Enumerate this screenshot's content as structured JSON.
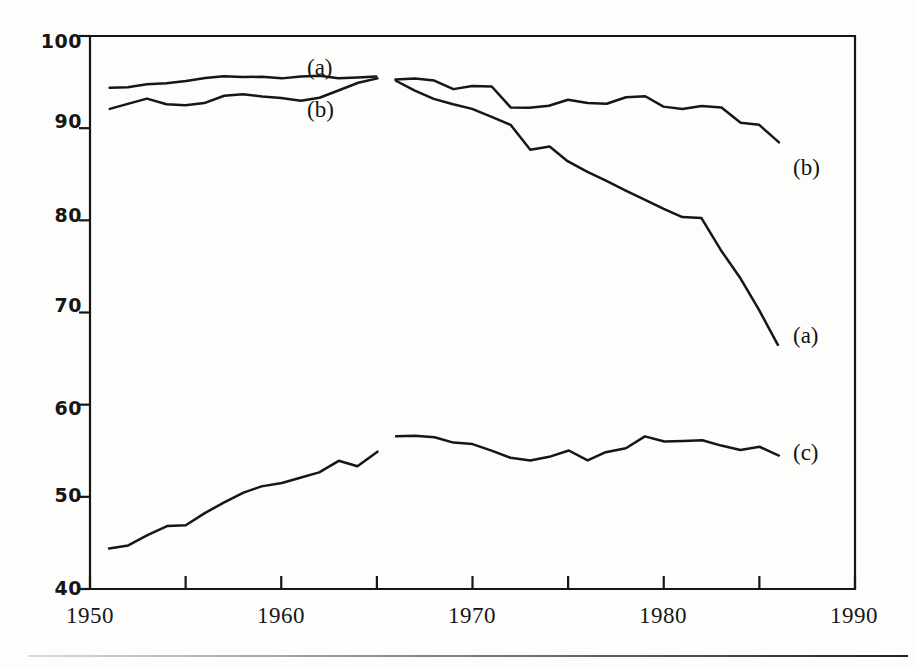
{
  "figure": {
    "background_color": "#fdfdfb",
    "ink_color": "#161616"
  },
  "axes": {
    "y_ticks": [
      "100",
      "90",
      "80",
      "70",
      "60",
      "50",
      "40"
    ],
    "x_ticks": [
      "1950",
      "1960",
      "1970",
      "1980",
      "1990"
    ]
  },
  "labels": {
    "a_left": "(a)",
    "b_left": "(b)",
    "b_right": "(b)",
    "a_right": "(a)",
    "c_right": "(c)"
  },
  "chart_data": {
    "type": "line",
    "title": "",
    "xlabel": "",
    "ylabel": "",
    "xlim": [
      1950,
      1990
    ],
    "ylim": [
      40,
      100
    ],
    "grid": false,
    "legend": "inline-annotations",
    "x_tick_values": [
      1950,
      1960,
      1970,
      1980,
      1990
    ],
    "x_minor_tick_values": [
      1955,
      1965,
      1975,
      1985
    ],
    "y_tick_values": [
      40,
      50,
      60,
      70,
      80,
      90,
      100
    ],
    "note": "Each series is drawn as two disjoint segments with a break between 1965 and 1966.",
    "series": [
      {
        "name": "(a)",
        "label_left": "(a)",
        "label_right": "(a)",
        "segments": [
          {
            "period": "1951-1965",
            "x": [
              1951,
              1952,
              1953,
              1954,
              1955,
              1956,
              1957,
              1958,
              1959,
              1960,
              1961,
              1962,
              1963,
              1964,
              1965
            ],
            "y": [
              94.4,
              94.5,
              94.7,
              94.9,
              95.1,
              95.4,
              95.6,
              95.6,
              95.5,
              95.5,
              95.5,
              95.6,
              95.5,
              95.4,
              95.6
            ]
          },
          {
            "period": "1966-1986",
            "x": [
              1966,
              1967,
              1968,
              1969,
              1970,
              1971,
              1972,
              1973,
              1974,
              1975,
              1976,
              1977,
              1978,
              1979,
              1980,
              1981,
              1982,
              1983,
              1984,
              1985,
              1986
            ],
            "y": [
              95.2,
              94.0,
              93.2,
              92.6,
              92.0,
              91.3,
              90.3,
              87.6,
              88.0,
              86.4,
              85.2,
              84.2,
              83.2,
              82.2,
              81.3,
              80.4,
              80.2,
              76.8,
              73.6,
              70.4,
              66.5
            ]
          }
        ]
      },
      {
        "name": "(b)",
        "label_left": "(b)",
        "label_right": "(b)",
        "segments": [
          {
            "period": "1951-1965",
            "x": [
              1951,
              1952,
              1953,
              1954,
              1955,
              1956,
              1957,
              1958,
              1959,
              1960,
              1961,
              1962,
              1963,
              1964,
              1965
            ],
            "y": [
              92.0,
              92.6,
              93.2,
              92.6,
              92.4,
              92.8,
              93.5,
              93.6,
              93.5,
              93.2,
              93.0,
              93.4,
              94.2,
              95.0,
              95.5
            ]
          },
          {
            "period": "1966-1986",
            "x": [
              1966,
              1967,
              1968,
              1969,
              1970,
              1971,
              1972,
              1973,
              1974,
              1975,
              1976,
              1977,
              1978,
              1979,
              1980,
              1981,
              1982,
              1983,
              1984,
              1985,
              1986
            ],
            "y": [
              95.3,
              95.4,
              95.2,
              94.2,
              94.6,
              94.5,
              92.3,
              92.3,
              92.4,
              93.0,
              92.8,
              92.6,
              93.4,
              93.5,
              92.4,
              92.0,
              92.5,
              92.3,
              90.6,
              90.3,
              88.5
            ]
          }
        ]
      },
      {
        "name": "(c)",
        "label_right": "(c)",
        "segments": [
          {
            "period": "1951-1965",
            "x": [
              1951,
              1952,
              1953,
              1954,
              1955,
              1956,
              1957,
              1958,
              1959,
              1960,
              1961,
              1962,
              1963,
              1964,
              1965
            ],
            "y": [
              44.3,
              44.8,
              45.8,
              46.9,
              47.0,
              48.2,
              49.4,
              50.5,
              51.2,
              51.5,
              52.0,
              52.6,
              54.0,
              53.4,
              55.0
            ]
          },
          {
            "period": "1966-1986",
            "x": [
              1966,
              1967,
              1968,
              1969,
              1970,
              1971,
              1972,
              1973,
              1974,
              1975,
              1976,
              1977,
              1978,
              1979,
              1980,
              1981,
              1982,
              1983,
              1984,
              1985,
              1986
            ],
            "y": [
              56.5,
              56.6,
              56.5,
              55.8,
              55.7,
              55.0,
              54.3,
              54.0,
              54.4,
              55.0,
              54.0,
              54.8,
              55.2,
              56.6,
              56.0,
              56.1,
              56.2,
              55.6,
              55.1,
              55.4,
              54.5
            ]
          }
        ]
      }
    ]
  }
}
